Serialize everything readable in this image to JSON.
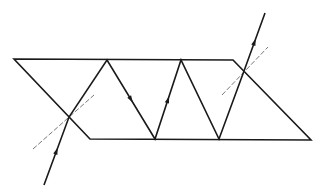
{
  "diagram": {
    "title": "Light ray undergoing total internal reflection inside a parallelogram prism",
    "colors": {
      "background": "#ffffff",
      "stroke": "#1a1a1a",
      "normal": "#555555"
    },
    "prism": {
      "shape": "parallelogram",
      "vertices": [
        [
          14,
          59
        ],
        [
          233,
          60
        ],
        [
          311,
          140
        ],
        [
          90,
          139
        ]
      ]
    },
    "ray": {
      "points": [
        [
          44,
          185
        ],
        [
          69,
          117
        ],
        [
          107,
          60
        ],
        [
          155,
          139
        ],
        [
          181,
          60
        ],
        [
          219,
          139
        ],
        [
          244,
          71
        ],
        [
          265,
          13
        ]
      ],
      "arrows": [
        {
          "segment": 0,
          "direction": "up"
        },
        {
          "segment": 2,
          "direction": "down"
        },
        {
          "segment": 3,
          "direction": "up"
        },
        {
          "segment": 6,
          "direction": "up"
        }
      ]
    },
    "normals": [
      {
        "name": "entry-normal",
        "from": [
          33,
          149
        ],
        "to": [
          94,
          95
        ]
      },
      {
        "name": "exit-normal",
        "from": [
          222,
          95
        ],
        "to": [
          268,
          47
        ]
      }
    ]
  }
}
